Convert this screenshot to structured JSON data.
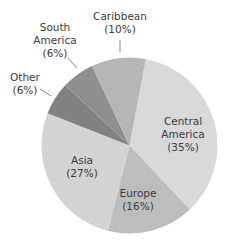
{
  "chart_data": {
    "type": "pie",
    "title": "",
    "start_angle_deg_clockwise_from_top": 10.7,
    "direction": "clockwise",
    "legend": "none (direct labels)",
    "slices": [
      {
        "label": "Central America",
        "value": 35,
        "pct_text": "(35%)",
        "color": "#d9d9d9",
        "label_lines": [
          "Central",
          "America",
          "(35%)"
        ],
        "label_x": 183,
        "label_y": 125
      },
      {
        "label": "Europe",
        "value": 16,
        "pct_text": "(16%)",
        "color": "#bdbdbd",
        "label_lines": [
          "Europe",
          "(16%)"
        ],
        "label_x": 138,
        "label_y": 197
      },
      {
        "label": "Asia",
        "value": 27,
        "pct_text": "(27%)",
        "color": "#d3d3d3",
        "label_lines": [
          "Asia",
          "(27%)"
        ],
        "label_x": 82,
        "label_y": 164
      },
      {
        "label": "Other",
        "value": 6,
        "pct_text": "(6%)",
        "color": "#818181",
        "label_lines": [
          "Other",
          "(6%)"
        ],
        "label_x": 25,
        "label_y": 81,
        "leader": [
          40,
          89,
          51,
          96
        ]
      },
      {
        "label": "South America",
        "value": 6,
        "pct_text": "(6%)",
        "color": "#8f8f8f",
        "label_lines": [
          "South",
          "America",
          "(6%)"
        ],
        "label_x": 55,
        "label_y": 31,
        "leader": [
          68,
          58,
          77,
          68
        ]
      },
      {
        "label": "Caribbean",
        "value": 10,
        "pct_text": "(10%)",
        "color": "#b6b6b6",
        "label_lines": [
          "Caribbean",
          "(10%)"
        ],
        "label_x": 120,
        "label_y": 20,
        "leader": [
          120,
          40,
          120,
          52
        ]
      }
    ],
    "categories": [
      "Central America",
      "Europe",
      "Asia",
      "Other",
      "South America",
      "Caribbean"
    ],
    "values": [
      35,
      16,
      27,
      6,
      6,
      10
    ],
    "center": [
      129.5,
      145.5
    ],
    "radius": 88
  }
}
